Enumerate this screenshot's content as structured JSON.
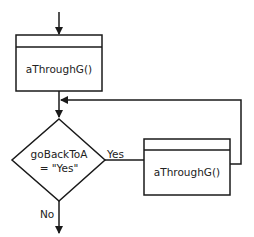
{
  "diagram": {
    "type": "flowchart",
    "colors": {
      "stroke": "#1a1a1a",
      "text": "#222222",
      "background": "#ffffff"
    },
    "nodes": {
      "top_process": {
        "label": "aThroughG()"
      },
      "decision": {
        "line1": "goBackToA",
        "line2": "= \"Yes\""
      },
      "loop_process": {
        "label": "aThroughG()"
      }
    },
    "edges": {
      "yes_label": "Yes",
      "no_label": "No"
    }
  }
}
